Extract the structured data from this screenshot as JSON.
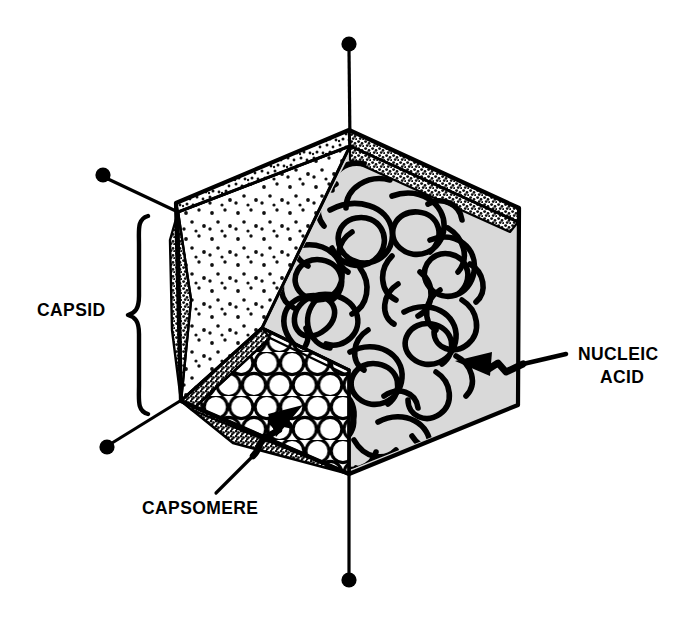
{
  "figure": {
    "background_color": "#ffffff",
    "ink_color": "#000000",
    "interior_gray": "#d9d9d9"
  },
  "labels": {
    "capsid": "CAPSID",
    "capsomere": "CAPSOMERE",
    "nucleic_acid_line1": "NUCLEIC",
    "nucleic_acid_line2": "ACID"
  },
  "annotations": [
    {
      "name": "capsid",
      "text": "CAPSID",
      "connector": "curly-brace",
      "brace_top": 215,
      "brace_bottom": 415,
      "text_x": 37,
      "text_y": 316
    },
    {
      "name": "capsomere",
      "text": "CAPSOMERE",
      "connector": "zigzag-arrow",
      "points_to": "circle-packed-facet",
      "text_x": 142,
      "text_y": 514
    },
    {
      "name": "nucleic-acid",
      "text": "NUCLEIC ACID",
      "connector": "zigzag-arrow",
      "points_to": "interior-coil",
      "text_x": 578,
      "text_y": 360
    }
  ],
  "vertex_pins": [
    {
      "name": "pin-top",
      "dot_x": 349,
      "dot_y": 44,
      "stem_to_x": 350,
      "stem_to_y": 145
    },
    {
      "name": "pin-upper-left",
      "dot_x": 103,
      "dot_y": 175,
      "stem_to_x": 178,
      "stem_to_y": 212
    },
    {
      "name": "pin-lower-left",
      "dot_x": 107,
      "dot_y": 447,
      "stem_to_x": 180,
      "stem_to_y": 401
    },
    {
      "name": "pin-bottom",
      "dot_x": 349,
      "dot_y": 580,
      "stem_to_x": 349,
      "stem_to_y": 474
    }
  ],
  "facets": [
    {
      "name": "facet-top-left-rear",
      "fill": "stipple-medium",
      "description": "upper rear left triangular band"
    },
    {
      "name": "facet-top-right-rear",
      "fill": "stipple-dense",
      "description": "upper rear right triangular band"
    },
    {
      "name": "facet-left-large",
      "fill": "stipple-sparse",
      "description": "large left front facet"
    },
    {
      "name": "facet-left-edge",
      "fill": "stipple-dense",
      "description": "narrow left edge facet"
    },
    {
      "name": "facet-lower-left",
      "fill": "stipple-dense",
      "description": "lower left facet below cut"
    },
    {
      "name": "facet-capsomere",
      "fill": "circle-packing",
      "description": "cutaway facet showing capsomere subunits"
    },
    {
      "name": "facet-interior",
      "fill": "solid-gray",
      "description": "interior cavity revealed by cutaway"
    }
  ]
}
